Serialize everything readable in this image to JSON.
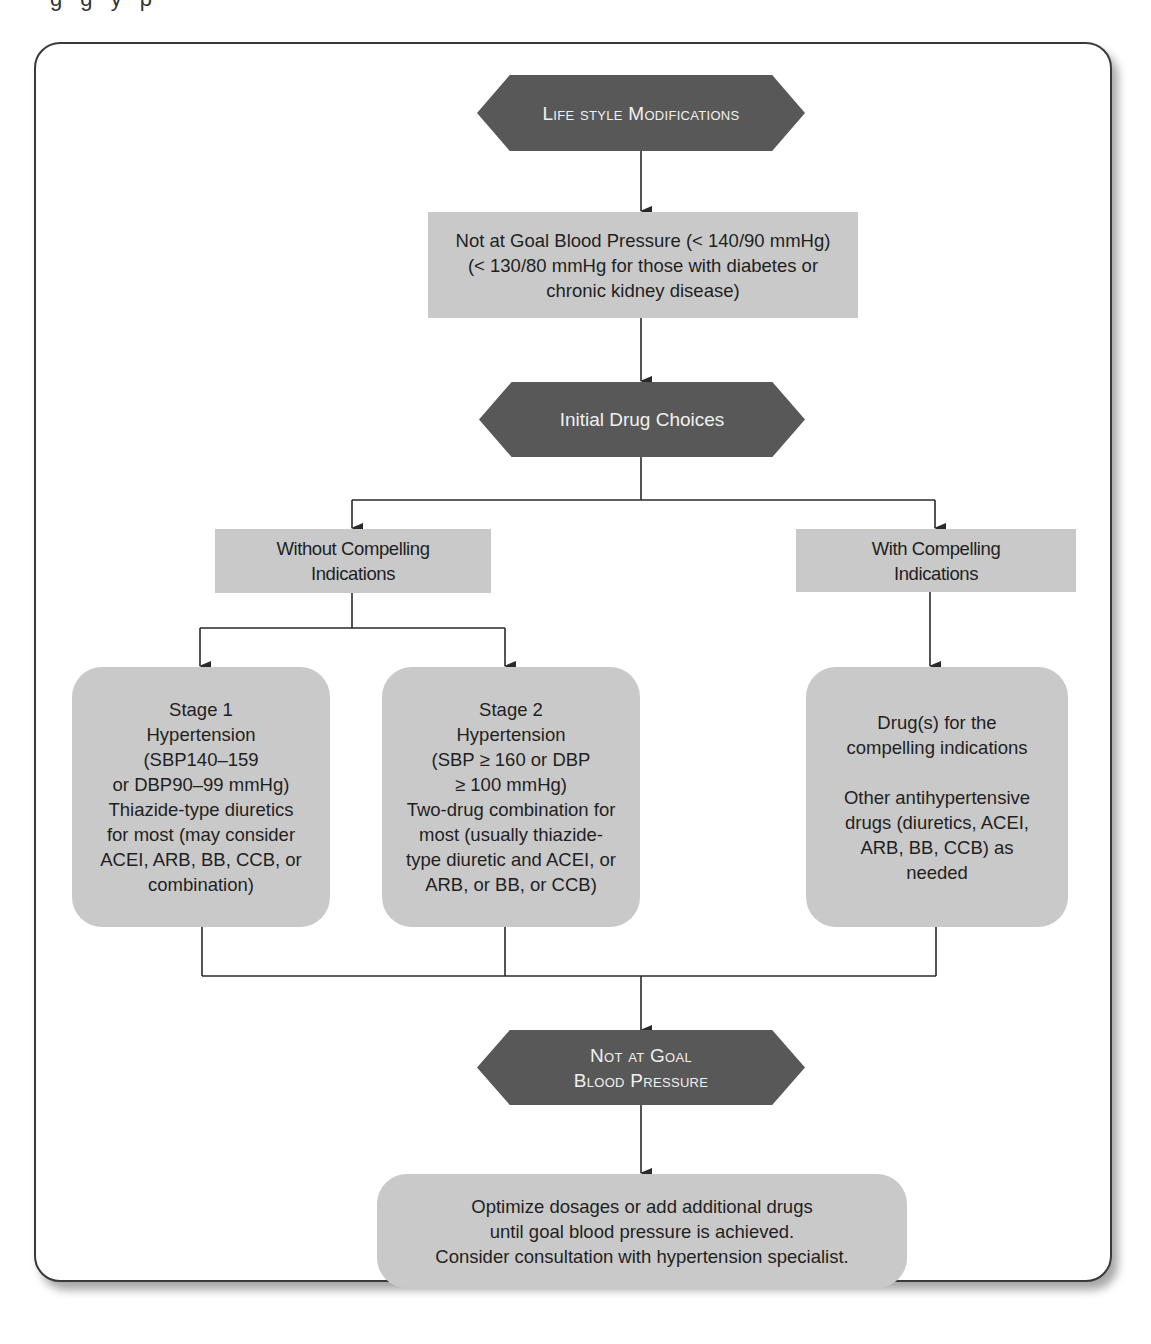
{
  "header_fragment": "g g y p",
  "flowchart": {
    "title_node": {
      "label": "Life style Modifications",
      "shape": "hexagon"
    },
    "goal_check_1": {
      "lines": [
        "Not at Goal Blood Pressure (< 140/90 mmHg)",
        "(< 130/80 mmHg for those with diabetes or",
        "chronic kidney disease)"
      ],
      "text": "Not at Goal Blood Pressure (< 140/90 mmHg)\n(< 130/80 mmHg for those with diabetes or\nchronic kidney disease)",
      "shape": "rectangle"
    },
    "initial_drug_choices": {
      "label": "Initial Drug Choices",
      "shape": "hexagon"
    },
    "without_compelling": {
      "text": "Without Compelling\nIndications",
      "shape": "rectangle"
    },
    "with_compelling": {
      "text": "With Compelling\nIndications",
      "shape": "rectangle"
    },
    "stage1": {
      "text": "Stage 1\nHypertension\n(SBP140–159\nor DBP90–99 mmHg)\nThiazide-type diuretics\nfor most (may consider\nACEI, ARB, BB, CCB, or\ncombination)",
      "shape": "rounded-rectangle"
    },
    "stage2": {
      "text": "Stage 2\nHypertension\n(SBP ≥ 160 or DBP\n≥ 100 mmHg)\nTwo-drug combination for\nmost (usually thiazide-\ntype diuretic and ACEI, or\nARB, or BB, or CCB)",
      "shape": "rounded-rectangle"
    },
    "compelling_drugs": {
      "text": "Drug(s) for the\ncompelling indications\n\nOther antihypertensive\ndrugs (diuretics, ACEI,\nARB, BB, CCB) as\nneeded",
      "shape": "rounded-rectangle"
    },
    "goal_check_2": {
      "line1": "Not at Goal",
      "line2": "Blood Pressure",
      "shape": "hexagon"
    },
    "final_action": {
      "text": "Optimize dosages or add additional drugs\nuntil goal blood pressure is achieved.\nConsider consultation with hypertension specialist.",
      "shape": "rounded-rectangle"
    },
    "edges": [
      [
        "title_node",
        "goal_check_1"
      ],
      [
        "goal_check_1",
        "initial_drug_choices"
      ],
      [
        "initial_drug_choices",
        "without_compelling"
      ],
      [
        "initial_drug_choices",
        "with_compelling"
      ],
      [
        "without_compelling",
        "stage1"
      ],
      [
        "without_compelling",
        "stage2"
      ],
      [
        "with_compelling",
        "compelling_drugs"
      ],
      [
        "stage1",
        "goal_check_2"
      ],
      [
        "stage2",
        "goal_check_2"
      ],
      [
        "compelling_drugs",
        "goal_check_2"
      ],
      [
        "goal_check_2",
        "final_action"
      ]
    ]
  },
  "colors": {
    "hexagon_fill": "#585858",
    "hexagon_text": "#f0f0f0",
    "box_fill": "#c9c9c9",
    "line": "#2a2a2a",
    "frame_border": "#3a3a3a"
  }
}
